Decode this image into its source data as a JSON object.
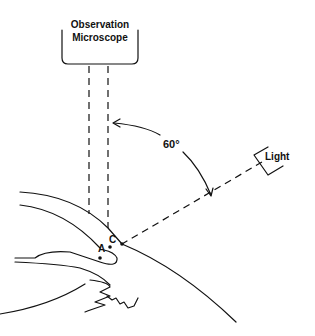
{
  "diagram": {
    "microscope": {
      "line1": "Observation",
      "line2": "Microscope"
    },
    "light": {
      "label": "Light"
    },
    "angle": {
      "label": "60°",
      "value_degrees": 60
    },
    "points": {
      "a": "A",
      "c": "C"
    },
    "colors": {
      "ink": "#111111",
      "background": "#ffffff"
    }
  }
}
